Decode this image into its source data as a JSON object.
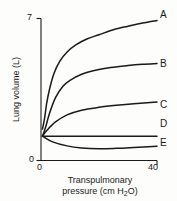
{
  "chart_data": {
    "type": "line",
    "title": "",
    "xlabel": "Transpulmonary pressure (cm H2O)",
    "xlabel_main": "Transpulmonary",
    "xlabel_sub_pre": "pressure (cm H",
    "xlabel_sub_num": "2",
    "xlabel_sub_post": "O)",
    "ylabel": "Lung volume (L)",
    "xlim": [
      0,
      40
    ],
    "ylim": [
      0,
      7
    ],
    "xticks": [
      "0",
      "40"
    ],
    "yticks": [
      "0",
      "7"
    ],
    "grid": false,
    "legend_position": "right-inline-labels",
    "series": [
      {
        "name": "A",
        "label": "A",
        "color": "#1a1a1a",
        "x": [
          0.5,
          1.2,
          2.0,
          3.0,
          4.5,
          6.5,
          9.0,
          12.0,
          16.0,
          20.0,
          25.0,
          30.0,
          35.0,
          40.0
        ],
        "y": [
          1.55,
          2.05,
          2.85,
          3.55,
          4.3,
          4.9,
          5.35,
          5.7,
          6.0,
          6.2,
          6.45,
          6.62,
          6.78,
          6.9
        ]
      },
      {
        "name": "B",
        "label": "B",
        "color": "#1a1a1a",
        "x": [
          0.5,
          1.5,
          3.0,
          5.0,
          7.5,
          10.0,
          14.0,
          18.0,
          24.0,
          30.0,
          35.0,
          40.0
        ],
        "y": [
          1.2,
          1.6,
          2.35,
          3.1,
          3.65,
          3.95,
          4.25,
          4.42,
          4.58,
          4.68,
          4.74,
          4.78
        ]
      },
      {
        "name": "C",
        "label": "C",
        "color": "#1a1a1a",
        "x": [
          0.5,
          2.0,
          5.0,
          9.0,
          14.0,
          20.0,
          26.0,
          32.0,
          40.0
        ],
        "y": [
          1.2,
          1.48,
          1.9,
          2.25,
          2.48,
          2.62,
          2.72,
          2.8,
          2.88
        ]
      },
      {
        "name": "D",
        "label": "D",
        "color": "#1a1a1a",
        "x": [
          0.5,
          10.0,
          20.0,
          30.0,
          40.0
        ],
        "y": [
          1.2,
          1.2,
          1.2,
          1.2,
          1.2
        ]
      },
      {
        "name": "E",
        "label": "E",
        "color": "#1a1a1a",
        "x": [
          0.5,
          4.0,
          9.0,
          14.0,
          20.0,
          26.0,
          32.0,
          40.0
        ],
        "y": [
          1.2,
          0.92,
          0.72,
          0.62,
          0.58,
          0.6,
          0.64,
          0.7
        ]
      }
    ]
  }
}
